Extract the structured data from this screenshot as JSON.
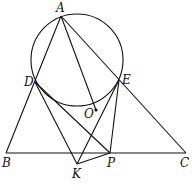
{
  "diagram": {
    "type": "geometry",
    "labels": {
      "A": "A",
      "D": "D",
      "E": "E",
      "O": "O",
      "B": "B",
      "C": "C",
      "K": "K",
      "P": "P"
    },
    "points": {
      "A": [
        61,
        16
      ],
      "D": [
        35,
        82
      ],
      "E": [
        119,
        80
      ],
      "O": [
        96,
        110
      ],
      "B": [
        6,
        153
      ],
      "C": [
        186,
        153
      ],
      "K": [
        77,
        164
      ],
      "P": [
        110,
        153
      ]
    },
    "circle": {
      "cx": 77,
      "cy": 60,
      "r": 46
    },
    "segments": [
      [
        "A",
        "B"
      ],
      [
        "A",
        "C"
      ],
      [
        "B",
        "C"
      ],
      [
        "A",
        "O"
      ],
      [
        "D",
        "K"
      ],
      [
        "D",
        "P"
      ],
      [
        "E",
        "K"
      ],
      [
        "E",
        "P"
      ],
      [
        "K",
        "P"
      ]
    ],
    "line_color": "#111111"
  }
}
